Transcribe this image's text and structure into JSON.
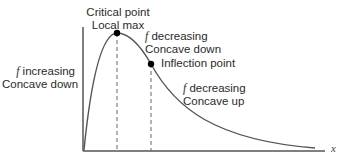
{
  "diagram": {
    "axis_label_x": "x",
    "annotations": {
      "critical_point": {
        "line1": "Critical point",
        "line2": "Local max"
      },
      "left_region": {
        "f_symbol": "f",
        "line1_rest": " increasing",
        "line2": "Concave down"
      },
      "middle_region": {
        "f_symbol": "f",
        "line1_rest": " decreasing",
        "line2": "Concave down"
      },
      "inflection_point": {
        "label": "Inflection point"
      },
      "right_region": {
        "f_symbol": "f",
        "line1_rest": " decreasing",
        "line2": "Concave up"
      }
    },
    "colors": {
      "curve": "#555555",
      "axis": "#555555",
      "point": "#000000",
      "dash": "#666666"
    }
  }
}
